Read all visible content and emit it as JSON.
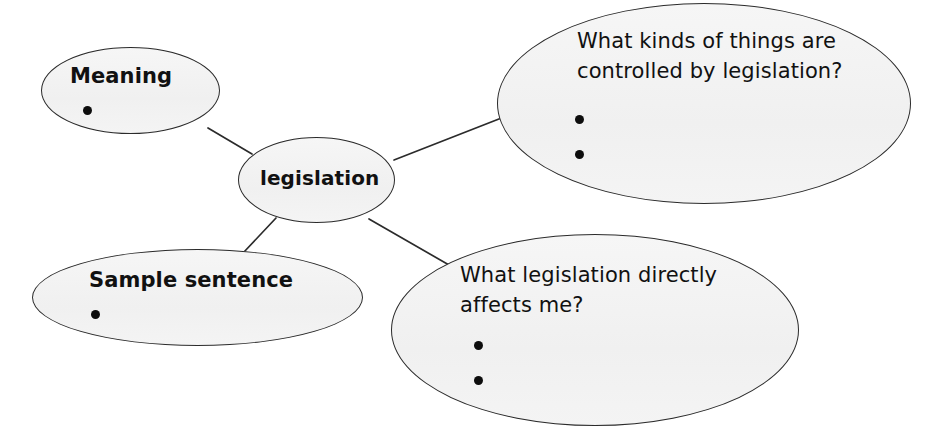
{
  "diagram": {
    "type": "concept-map",
    "title_word": "legislation",
    "canvas": {
      "width": 934,
      "height": 444,
      "background": "#ffffff"
    },
    "style": {
      "node_fill": "#f3f3f3",
      "node_stroke": "#2b2b2b",
      "edge_stroke": "#2b2b2b",
      "text_color": "#111111",
      "bullet_color": "#0d0d0d"
    },
    "nodes": [
      {
        "id": "meaning",
        "label": "Meaning",
        "kind": "heading",
        "bullets": 1
      },
      {
        "id": "legislation",
        "label": "legislation",
        "kind": "center",
        "bullets": 0
      },
      {
        "id": "kinds",
        "label": "What kinds of things are\ncontrolled by legislation?",
        "kind": "question",
        "bullets": 2
      },
      {
        "id": "sample",
        "label": "Sample sentence",
        "kind": "heading",
        "bullets": 1
      },
      {
        "id": "affects",
        "label": "What legislation directly\naffects me?",
        "kind": "question",
        "bullets": 2
      }
    ],
    "edges": [
      {
        "from": "legislation",
        "to": "meaning",
        "x1": 252,
        "y1": 154,
        "x2": 208,
        "y2": 128
      },
      {
        "from": "legislation",
        "to": "kinds",
        "x1": 394,
        "y1": 160,
        "x2": 504,
        "y2": 117
      },
      {
        "from": "legislation",
        "to": "sample",
        "x1": 276,
        "y1": 218,
        "x2": 244,
        "y2": 252
      },
      {
        "from": "legislation",
        "to": "affects",
        "x1": 369,
        "y1": 219,
        "x2": 456,
        "y2": 269
      }
    ]
  }
}
